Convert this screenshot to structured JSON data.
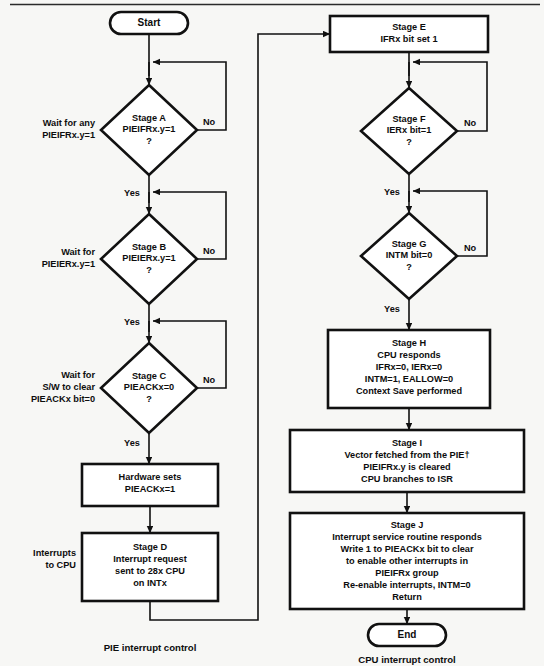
{
  "figure": {
    "title_caption": "",
    "top_rule": true
  },
  "terminals": {
    "start": "Start",
    "end": "End"
  },
  "left_column": {
    "footer_label": "PIE interrupt control",
    "side_labels": [
      {
        "id": "wait-any-pieifr",
        "lines": [
          "Wait for any",
          "PIEIFRx.y=1"
        ]
      },
      {
        "id": "wait-pieier",
        "lines": [
          "Wait for",
          "PIEIERx.y=1"
        ]
      },
      {
        "id": "wait-sw-clear",
        "lines": [
          "Wait for",
          "S/W to clear",
          "PIEACKx bit=0"
        ]
      },
      {
        "id": "interrupts-to-cpu",
        "lines": [
          "Interrupts",
          "to CPU"
        ]
      }
    ],
    "decisions": [
      {
        "id": "stage-a",
        "lines": [
          "Stage A",
          "PIEIFRx.y=1",
          "?"
        ],
        "yes_label": "Yes",
        "no_label": "No"
      },
      {
        "id": "stage-b",
        "lines": [
          "Stage B",
          "PIEIERx.y=1",
          "?"
        ],
        "yes_label": "Yes",
        "no_label": "No"
      },
      {
        "id": "stage-c",
        "lines": [
          "Stage C",
          "PIEACKx=0",
          "?"
        ],
        "yes_label": "Yes",
        "no_label": "No"
      }
    ],
    "processes": [
      {
        "id": "hardware-sets",
        "lines": [
          "Hardware sets",
          "PIEACKx=1"
        ]
      },
      {
        "id": "stage-d",
        "lines": [
          "Stage D",
          "Interrupt request",
          "sent to 28x CPU",
          "on INTx"
        ]
      }
    ]
  },
  "right_column": {
    "footer_label": "CPU interrupt control",
    "decisions": [
      {
        "id": "stage-f",
        "lines": [
          "Stage F",
          "IERx bit=1",
          "?"
        ],
        "yes_label": "Yes",
        "no_label": "No"
      },
      {
        "id": "stage-g",
        "lines": [
          "Stage G",
          "INTM bit=0",
          "?"
        ],
        "yes_label": "Yes",
        "no_label": "No"
      }
    ],
    "processes": [
      {
        "id": "stage-e",
        "lines": [
          "Stage E",
          "IFRx bit set 1"
        ]
      },
      {
        "id": "stage-h",
        "lines": [
          "Stage H",
          "CPU responds",
          "IFRx=0, IERx=0",
          "INTM=1, EALLOW=0",
          "Context Save performed"
        ]
      },
      {
        "id": "stage-i",
        "lines": [
          "Stage I",
          "Vector fetched from the PIE†",
          "PIEIFRx.y is cleared",
          "CPU branches to ISR"
        ]
      },
      {
        "id": "stage-j",
        "lines": [
          "Stage J",
          "Interrupt service routine responds",
          "Write 1 to PIEACKx bit to clear",
          "to enable other interrupts in",
          "PIEIFRx group",
          "Re-enable interrupts, INTM=0",
          "Return"
        ]
      }
    ]
  },
  "colors": {
    "stroke": "#111111",
    "fill": "#ffffff",
    "page_bg": "#f7f7f5",
    "caption_gray": "#8e8e8e"
  }
}
